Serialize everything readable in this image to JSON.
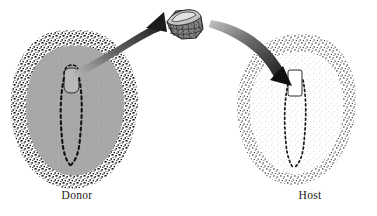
{
  "figure": {
    "background_color": "#ffffff",
    "width": 377,
    "height": 216
  },
  "labels": {
    "donor": "Donor",
    "host": "Host"
  },
  "colors": {
    "background": "#ffffff",
    "donor_inner": "#a8a8a8",
    "donor_ring_stipple": "#1c1c1c",
    "host_inner": "#fbfbfb",
    "host_ring_stipple": "#3a3a3a",
    "streak_dash": "#141414",
    "node_donor_fill": "#b9b9b9",
    "node_host_fill": "#ffffff",
    "graft_fill": "#9c9c9c",
    "graft_top": "#c4c4c4",
    "graft_outline": "#202020",
    "arrow_dark": "#262626",
    "arrow_light": "#b0b0b0",
    "label_text": "#1a1a1a"
  },
  "donor_embryo": {
    "name": "Donor embryo",
    "outer_ring_label": "area opaca stippled margin",
    "inner_region_label": "area pellucida",
    "node_label": "Hensen's node",
    "streak_label": "primitive streak"
  },
  "host_embryo": {
    "name": "Host embryo",
    "outer_ring_label": "area opaca stippled margin",
    "inner_region_label": "area pellucida",
    "node_label": "graft site node",
    "streak_label": "primitive streak"
  },
  "graft": {
    "name": "Excised node tissue block",
    "texture_label": "cellular block texture"
  },
  "arrows": [
    {
      "name": "donor-to-graft",
      "direction": "up-right",
      "shading": "light tail to dark head"
    },
    {
      "name": "graft-to-host",
      "direction": "down-right",
      "shading": "light tail to dark head"
    }
  ]
}
